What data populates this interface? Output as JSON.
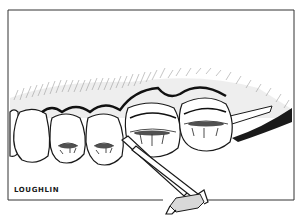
{
  "illustration": {
    "subject": "dental-teeth-with-clamp-instrument",
    "style": "black-and-white pen line drawing",
    "signature": "LOUGHLIN",
    "colors": {
      "ink": "#1a1a1a",
      "paper": "#ffffff",
      "hatch": "#555555"
    }
  }
}
